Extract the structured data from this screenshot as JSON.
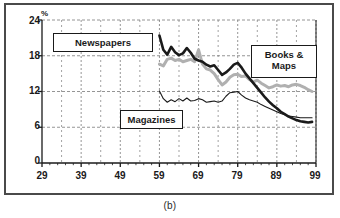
{
  "caption": "(b)",
  "chart_data": {
    "type": "line",
    "title": "",
    "subtitle": "",
    "xlabel": "",
    "ylabel": "%",
    "ylim": [
      0,
      24
    ],
    "xlim": [
      29,
      99
    ],
    "yticks": [
      0,
      6,
      12,
      18,
      24
    ],
    "xticks": [
      29,
      39,
      49,
      59,
      69,
      79,
      89,
      99
    ],
    "minor_x_tick_interval": 2,
    "grid": true,
    "grid_style": "dashed",
    "legend_position": "inline-boxed-labels",
    "annotations": [
      {
        "text": "Newspapers",
        "x": 44,
        "y": 20.5
      },
      {
        "text": "Books & Maps",
        "x": 90,
        "y": 17.5
      },
      {
        "text": "Magazines",
        "x": 61,
        "y": 8.5
      }
    ],
    "series": [
      {
        "name": "Newspapers",
        "color": "#1a1a1a",
        "width": 2.6,
        "x": [
          59,
          60,
          61,
          62,
          63,
          64,
          65,
          66,
          67,
          68,
          69,
          70,
          71,
          72,
          73,
          74,
          75,
          76,
          77,
          78,
          79,
          80,
          81,
          82,
          83,
          84,
          85,
          86,
          87,
          88,
          89,
          90,
          91,
          92,
          93,
          94,
          95,
          96,
          97,
          98
        ],
        "values": [
          21.4,
          19.0,
          18.2,
          19.5,
          18.6,
          18.1,
          18.4,
          19.3,
          18.5,
          17.5,
          17.2,
          17.0,
          16.5,
          16.2,
          16.4,
          15.6,
          14.8,
          15.2,
          15.8,
          16.5,
          16.8,
          16.0,
          15.0,
          14.2,
          13.4,
          12.6,
          11.8,
          11.0,
          10.3,
          9.7,
          9.2,
          8.6,
          8.2,
          7.8,
          7.5,
          7.2,
          7.0,
          6.9,
          6.8,
          6.9
        ]
      },
      {
        "name": "Books & Maps",
        "color": "#b0b0b0",
        "width": 3.0,
        "x": [
          59,
          60,
          61,
          62,
          63,
          64,
          65,
          66,
          67,
          68,
          69,
          70,
          71,
          72,
          73,
          74,
          75,
          76,
          77,
          78,
          79,
          80,
          81,
          82,
          83,
          84,
          85,
          86,
          87,
          88,
          89,
          90,
          91,
          92,
          93,
          94,
          95,
          96,
          97,
          98
        ],
        "values": [
          16.6,
          16.3,
          17.4,
          17.6,
          17.2,
          17.4,
          17.0,
          17.2,
          17.4,
          17.0,
          19.0,
          16.6,
          15.8,
          15.6,
          15.0,
          14.0,
          13.1,
          13.6,
          14.4,
          14.8,
          14.9,
          14.5,
          14.6,
          14.0,
          13.6,
          13.9,
          13.4,
          13.0,
          12.6,
          12.8,
          13.1,
          12.9,
          13.0,
          12.8,
          13.1,
          13.2,
          13.0,
          12.7,
          12.3,
          12.0
        ]
      },
      {
        "name": "Magazines",
        "color": "#1a1a1a",
        "width": 1.1,
        "x": [
          59,
          60,
          61,
          62,
          63,
          64,
          65,
          66,
          67,
          68,
          69,
          70,
          71,
          72,
          73,
          74,
          75,
          76,
          77,
          78,
          79,
          80,
          81,
          82,
          83,
          84,
          85,
          86,
          87,
          88,
          89,
          90,
          91,
          92,
          93,
          94,
          95,
          96,
          97,
          98
        ],
        "values": [
          12.1,
          10.8,
          10.2,
          10.6,
          10.3,
          10.8,
          10.4,
          10.9,
          10.4,
          10.5,
          10.8,
          10.6,
          10.2,
          10.3,
          10.4,
          10.2,
          10.4,
          11.2,
          11.8,
          11.9,
          12.0,
          11.4,
          10.9,
          10.6,
          10.4,
          10.2,
          9.8,
          9.5,
          9.2,
          8.9,
          8.6,
          8.3,
          8.1,
          7.9,
          7.8,
          7.7,
          7.6,
          7.6,
          7.6,
          7.6
        ]
      }
    ]
  },
  "axis": {
    "y_unit": "%",
    "y_labels": [
      "24",
      "18",
      "12",
      "6",
      "0"
    ],
    "x_labels": [
      "29",
      "39",
      "49",
      "59",
      "69",
      "79",
      "89",
      "99"
    ]
  },
  "labels": {
    "newspapers": "Newspapers",
    "books_maps_line1": "Books &",
    "books_maps_line2": "Maps",
    "magazines": "Magazines"
  },
  "colors": {
    "newspapers": "#1a1a1a",
    "books_maps": "#b0b0b0",
    "magazines": "#1a1a1a",
    "grid": "#7a7a7a",
    "axis": "#1a1a1a",
    "frame": "#4a4a4a"
  }
}
